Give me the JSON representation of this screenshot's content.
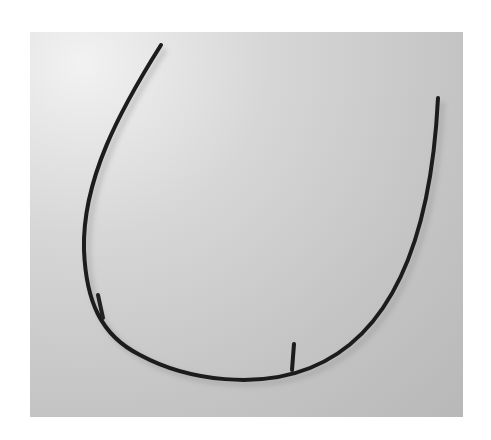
{
  "image": {
    "subject": "curved underwire",
    "background_color": "#c6c6c6",
    "frame_color": "#ffffff",
    "wire_color": "#1a1a1a"
  }
}
